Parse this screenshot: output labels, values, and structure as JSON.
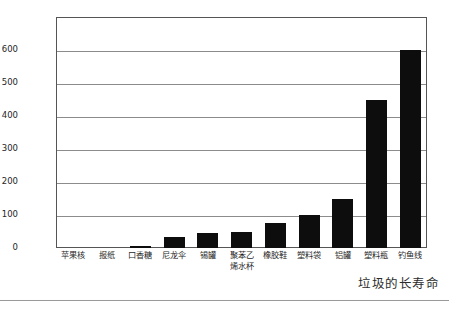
{
  "chart_data": {
    "type": "bar",
    "title": "",
    "subtitle": "",
    "xlabel": "",
    "ylabel": "存在时间/年",
    "ylim": [
      0,
      700
    ],
    "ytick_step": 100,
    "ytick_labels": [
      "0",
      "100",
      "200",
      "300",
      "400",
      "500",
      "600"
    ],
    "ytick_values": [
      0,
      100,
      200,
      300,
      400,
      500,
      600
    ],
    "grid": "horizontal",
    "legend": "none",
    "bar_color": "#0d0d0d",
    "categories": [
      "苹果核",
      "报纸",
      "口香糖",
      "尼龙伞",
      "锡罐",
      "聚苯乙烯\n水杯",
      "橡胶鞋",
      "塑料袋",
      "铝罐",
      "塑料瓶",
      "钓鱼线"
    ],
    "values": [
      0,
      0,
      5,
      33,
      47,
      48,
      76,
      100,
      148,
      450,
      600
    ]
  },
  "axis": {
    "y_title": "存在时间/年",
    "ticks": [
      {
        "label": "600",
        "value": 600
      },
      {
        "label": "500",
        "value": 500
      },
      {
        "label": "400",
        "value": 400
      },
      {
        "label": "300",
        "value": 300
      },
      {
        "label": "200",
        "value": 200
      },
      {
        "label": "100",
        "value": 100
      },
      {
        "label": "0",
        "value": 0
      }
    ]
  },
  "categories": [
    {
      "label": "苹果核",
      "value": 0
    },
    {
      "label": "报纸",
      "value": 0
    },
    {
      "label": "口香糖",
      "value": 5
    },
    {
      "label": "尼龙伞",
      "value": 33
    },
    {
      "label": "锡罐",
      "value": 47
    },
    {
      "label": "聚苯乙烯水杯",
      "value": 48
    },
    {
      "label": "橡胶鞋",
      "value": 76
    },
    {
      "label": "塑料袋",
      "value": 100
    },
    {
      "label": "铝罐",
      "value": 148
    },
    {
      "label": "塑料瓶",
      "value": 450
    },
    {
      "label": "钓鱼线",
      "value": 600
    }
  ],
  "caption": "垃圾的长寿命",
  "colors": {
    "bar": "#0d0d0d",
    "grid": "#8c8c8c",
    "frame": "#555555",
    "text": "#1f1f1f",
    "rule": "#9a9a9a"
  }
}
